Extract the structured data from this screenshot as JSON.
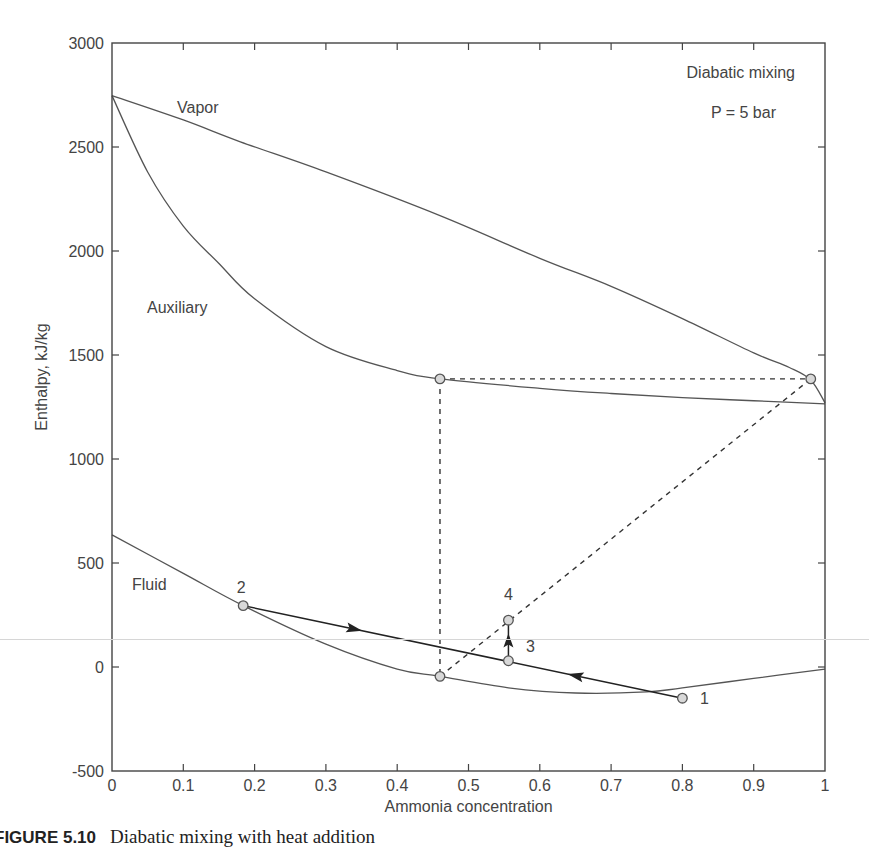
{
  "figure": {
    "caption_label": "FIGURE 5.10",
    "caption_text": "Diabatic mixing with heat addition"
  },
  "chart_data": {
    "type": "line",
    "title": "Diabatic mixing",
    "subtitle": "P = 5 bar",
    "xlabel": "Ammonia concentration",
    "ylabel": "Enthalpy, kJ/kg",
    "xlim": [
      0,
      1
    ],
    "ylim": [
      -500,
      3000
    ],
    "xticks": [
      "0",
      "0.1",
      "0.2",
      "0.3",
      "0.4",
      "0.5",
      "0.6",
      "0.7",
      "0.8",
      "0.9",
      "1"
    ],
    "yticks": [
      "-500",
      "0",
      "500",
      "1000",
      "1500",
      "2000",
      "2500",
      "3000"
    ],
    "grid": false,
    "legend": "none",
    "series": [
      {
        "name": "Vapor",
        "style": "solid",
        "x": [
          0,
          0.1,
          0.18,
          0.3,
          0.46,
          0.6,
          0.7,
          0.8,
          0.9,
          0.95,
          0.98,
          1.0
        ],
        "y": [
          2747,
          2630,
          2525,
          2380,
          2170,
          1965,
          1830,
          1675,
          1510,
          1440,
          1380,
          1270
        ]
      },
      {
        "name": "Auxiliary",
        "style": "solid",
        "x": [
          0,
          0.05,
          0.1,
          0.15,
          0.2,
          0.3,
          0.4,
          0.46,
          0.6,
          0.7,
          0.8,
          0.9,
          1.0
        ],
        "y": [
          2747,
          2380,
          2120,
          1940,
          1770,
          1540,
          1425,
          1385,
          1340,
          1315,
          1295,
          1280,
          1265
        ]
      },
      {
        "name": "Fluid",
        "style": "solid",
        "x": [
          0,
          0.1,
          0.184,
          0.3,
          0.4,
          0.46,
          0.556,
          0.65,
          0.75,
          0.8,
          0.9,
          1.0
        ],
        "y": [
          635,
          450,
          295,
          110,
          -10,
          -45,
          -100,
          -125,
          -120,
          -100,
          -55,
          -10
        ]
      }
    ],
    "process_lines": [
      {
        "name": "mixing 1-2",
        "style": "solid-arrow",
        "x": [
          0.8,
          0.184
        ],
        "y": [
          -150,
          295
        ],
        "arrows_at_x": [
          0.65,
          0.34
        ]
      },
      {
        "name": "heat addition 3-4",
        "style": "solid-arrow",
        "x": [
          0.556,
          0.556
        ],
        "y": [
          30,
          225
        ]
      },
      {
        "name": "auxiliary tie line",
        "style": "dashed",
        "x": [
          0.46,
          0.98
        ],
        "y": [
          1385,
          1385
        ]
      },
      {
        "name": "vertical construction",
        "style": "dashed",
        "x": [
          0.46,
          0.46
        ],
        "y": [
          1385,
          -45
        ]
      },
      {
        "name": "construction line",
        "style": "dashed",
        "x": [
          0.46,
          0.98
        ],
        "y": [
          -45,
          1385
        ]
      }
    ],
    "points": [
      {
        "label": "1",
        "x": 0.8,
        "y": -150
      },
      {
        "label": "2",
        "x": 0.184,
        "y": 295
      },
      {
        "label": "3",
        "x": 0.556,
        "y": 30
      },
      {
        "label": "4",
        "x": 0.556,
        "y": 225
      },
      {
        "label": "",
        "x": 0.46,
        "y": 1385
      },
      {
        "label": "",
        "x": 0.98,
        "y": 1385
      },
      {
        "label": "",
        "x": 0.46,
        "y": -45
      }
    ],
    "annotations": [
      "Vapor",
      "Auxiliary",
      "Fluid",
      "Diabatic mixing",
      "P = 5 bar"
    ]
  }
}
